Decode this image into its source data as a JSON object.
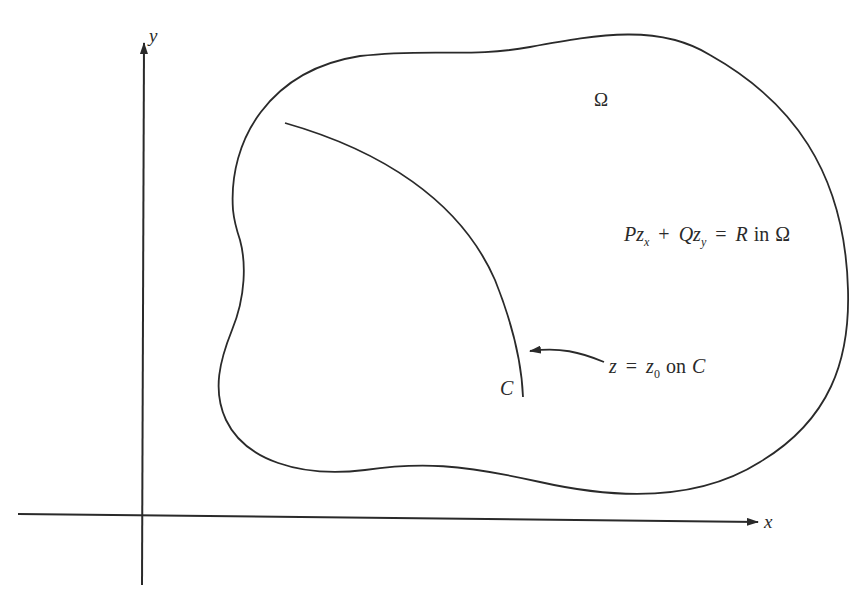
{
  "figure": {
    "type": "diagram",
    "colors": {
      "background": "#ffffff",
      "ink": "#2a2a2a"
    }
  },
  "axes": {
    "x_label": "x",
    "y_label": "y"
  },
  "region": {
    "label": "Ω"
  },
  "equation": {
    "P": "P",
    "z1": "z",
    "sub_x": "x",
    "plus": "+",
    "Q": "Q",
    "z2": "z",
    "sub_y": "y",
    "equals": "=",
    "R": "R",
    "in": "in",
    "omega": "Ω"
  },
  "curve": {
    "label": "C"
  },
  "boundary_condition": {
    "z": "z",
    "equals": "=",
    "z0": "z",
    "sub0": "0",
    "on": "on",
    "C": "C"
  }
}
